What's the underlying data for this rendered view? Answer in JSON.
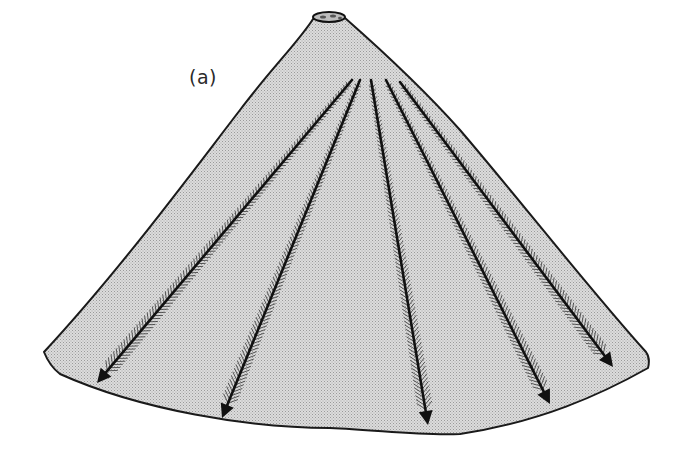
{
  "figure": {
    "panel_label": "(a)",
    "colors": {
      "cone_fill": "#d6d6d6",
      "outline": "#1a1a1a",
      "arrow": "#111111",
      "background": "#ffffff"
    },
    "cone": {
      "crater": {
        "cx": 329,
        "cy": 17,
        "rx": 16,
        "ry": 5
      },
      "left_base": [
        44,
        353
      ],
      "right_base": [
        648,
        358
      ],
      "bottom_lowest": [
        430,
        436
      ]
    },
    "arrows": [
      {
        "name": "drainage-arrow-1",
        "start": [
          352,
          80
        ],
        "end": [
          97,
          383
        ]
      },
      {
        "name": "drainage-arrow-2",
        "start": [
          360,
          80
        ],
        "end": [
          222,
          418
        ]
      },
      {
        "name": "drainage-arrow-3",
        "start": [
          371,
          80
        ],
        "end": [
          428,
          425
        ]
      },
      {
        "name": "drainage-arrow-4",
        "start": [
          386,
          80
        ],
        "end": [
          550,
          404
        ]
      },
      {
        "name": "drainage-arrow-5",
        "start": [
          400,
          82
        ],
        "end": [
          613,
          367
        ]
      }
    ]
  }
}
